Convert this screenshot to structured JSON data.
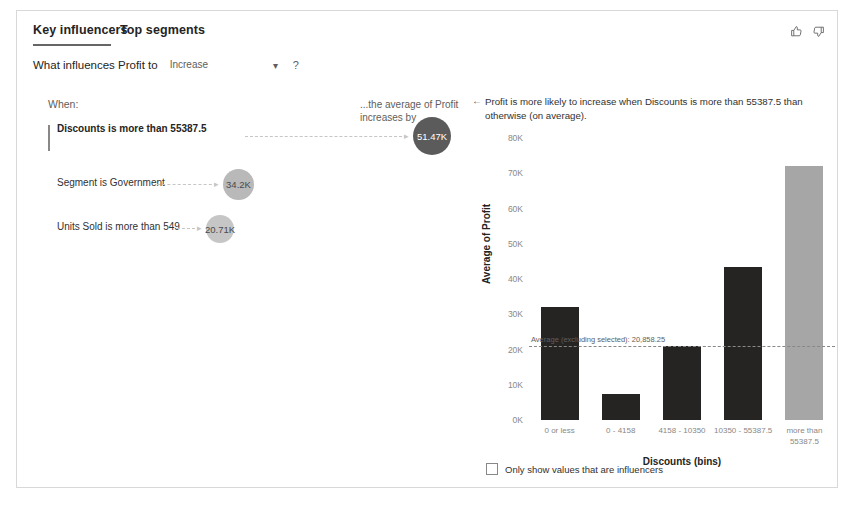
{
  "visual": {
    "tabs": [
      {
        "label": "Key influencers",
        "selected": true
      },
      {
        "label": "Top segments",
        "selected": false
      }
    ],
    "feedback": {
      "like_icon": "thumbs-up-icon",
      "dislike_icon": "thumbs-down-icon"
    }
  },
  "question": {
    "label": "What influences Profit to",
    "selected_value": "Increase",
    "options": [
      "Increase",
      "Decrease"
    ],
    "caret_icon": "chevron-down-icon",
    "help_icon": "question-mark-icon"
  },
  "left_pane": {
    "when_label": "When:",
    "average_label": "...the average of Profit increases by",
    "influencers": [
      {
        "label": "Discounts is more than 55387.5",
        "value": "51.47K",
        "selected": true,
        "bubble_size": 38,
        "bubble_style": "dark"
      },
      {
        "label": "Segment is Government",
        "value": "34.2K",
        "selected": false,
        "bubble_size": 31,
        "bubble_style": "mid"
      },
      {
        "label": "Units Sold is more than 549",
        "value": "20.71K",
        "selected": false,
        "bubble_size": 28,
        "bubble_style": "light"
      }
    ]
  },
  "right_pane": {
    "back_arrow_icon": "arrow-left-icon",
    "insight": "Profit is more likely to increase when Discounts is more than 55387.5 than otherwise (on average).",
    "filter": {
      "label": "Only show values that are influencers",
      "checked": false
    }
  },
  "chart_data": {
    "type": "bar",
    "title": "",
    "xlabel": "Discounts (bins)",
    "ylabel": "Average of Profit",
    "categories": [
      "0 or less",
      "0 - 4158",
      "4158 - 10350",
      "10350 - 55387.5",
      "more than 55387.5"
    ],
    "values": [
      32000,
      7300,
      21000,
      43500,
      72000
    ],
    "highlighted_index": 4,
    "ylim": [
      0,
      80000
    ],
    "ytick_labels": [
      "0K",
      "10K",
      "20K",
      "30K",
      "40K",
      "50K",
      "60K",
      "70K",
      "80K"
    ],
    "ytick_values": [
      0,
      10000,
      20000,
      30000,
      40000,
      50000,
      60000,
      70000,
      80000
    ],
    "grid": false,
    "legend": "none",
    "reference_line": {
      "label": "Average (excluding selected): 20,858.25",
      "value": 20858.25,
      "style": "dashed"
    },
    "bar_colors": {
      "default": "#252423",
      "highlighted": "#a6a6a6"
    }
  }
}
